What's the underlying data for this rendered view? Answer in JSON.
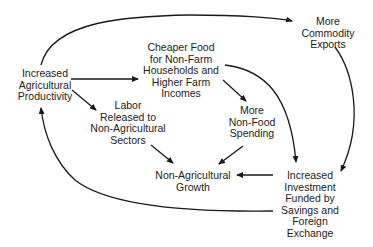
{
  "diagram": {
    "type": "flow-diagram",
    "colors": {
      "line": "#1a1a1a",
      "text": "#222222",
      "background": "#ffffff"
    },
    "nodes": {
      "productivity": "Increased\nAgricultural\nProductivity",
      "cheaper_food": "Cheaper Food\nfor Non-Farm\nHouseholds and\nHigher Farm\nIncomes",
      "exports": "More\nCommodity\nExports",
      "labor": "Labor\nReleased to\nNon-Agricultural\nSectors",
      "spending": "More\nNon-Food\nSpending",
      "growth": "Non-Agricultural\nGrowth",
      "investment": "Increased\nInvestment\nFunded by\nSavings and\nForeign\nExchange"
    },
    "edges": [
      {
        "from": "productivity",
        "to": "exports"
      },
      {
        "from": "productivity",
        "to": "cheaper_food"
      },
      {
        "from": "productivity",
        "to": "labor"
      },
      {
        "from": "cheaper_food",
        "to": "spending"
      },
      {
        "from": "cheaper_food",
        "to": "investment"
      },
      {
        "from": "exports",
        "to": "investment"
      },
      {
        "from": "labor",
        "to": "growth"
      },
      {
        "from": "spending",
        "to": "growth"
      },
      {
        "from": "investment",
        "to": "growth"
      },
      {
        "from": "investment",
        "to": "productivity"
      }
    ]
  }
}
